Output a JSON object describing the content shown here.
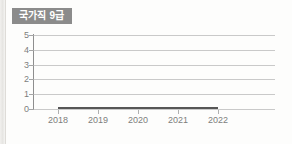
{
  "badge": {
    "label": "국가직 9급"
  },
  "colors": {
    "badge_background": "#8b8b8b",
    "badge_text": "#ffffff",
    "gridline": "#c9c9c9",
    "axis": "#8e8e8e",
    "tick_label": "#7d7d7d",
    "series_line": "#565656",
    "page_background": "#fdfdfc"
  },
  "chart_data": {
    "type": "line",
    "title": "국가직 9급",
    "xlabel": "",
    "ylabel": "",
    "categories": [
      "2018",
      "2019",
      "2020",
      "2021",
      "2022"
    ],
    "x": [
      2018,
      2019,
      2020,
      2021,
      2022
    ],
    "values": [
      0,
      0,
      0,
      0,
      0
    ],
    "series": [
      {
        "name": "국가직 9급",
        "values": [
          0,
          0,
          0,
          0,
          0
        ]
      }
    ],
    "y_ticks": [
      0,
      1,
      2,
      3,
      4,
      5
    ],
    "ylim": [
      0,
      5
    ],
    "grid": true,
    "legend": "none"
  }
}
